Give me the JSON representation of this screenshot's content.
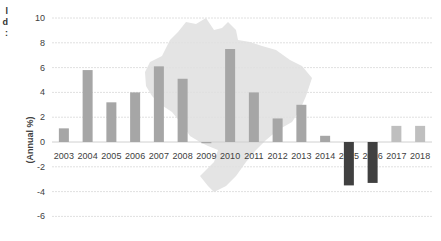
{
  "clipped_text": [
    "l",
    "d",
    ":"
  ],
  "colors": {
    "positive_bar": "#a6a6a6",
    "recent_bar": "#bfbfbf",
    "negative_bar": "#404040",
    "map_fill": "#e4e4e4",
    "grid": "#e0e0e0",
    "axis": "#d0d0d0"
  },
  "chart_data": {
    "type": "bar",
    "title": "",
    "xlabel": "",
    "ylabel": "(Annual %)",
    "ylim": [
      -6,
      10
    ],
    "yticks": [
      10,
      8,
      6,
      4,
      2,
      0,
      -2,
      -4,
      -6
    ],
    "grid": true,
    "legend": null,
    "background_image": "map-of-brazil silhouette",
    "categories": [
      "2003",
      "2004",
      "2005",
      "2006",
      "2007",
      "2008",
      "2009",
      "2010",
      "2011",
      "2012",
      "2013",
      "2014",
      "2015",
      "2016",
      "2017",
      "2018"
    ],
    "values": [
      1.1,
      5.8,
      3.2,
      4.0,
      6.1,
      5.1,
      -0.1,
      7.5,
      4.0,
      1.9,
      3.0,
      0.5,
      -3.5,
      -3.3,
      1.3,
      1.3
    ]
  }
}
